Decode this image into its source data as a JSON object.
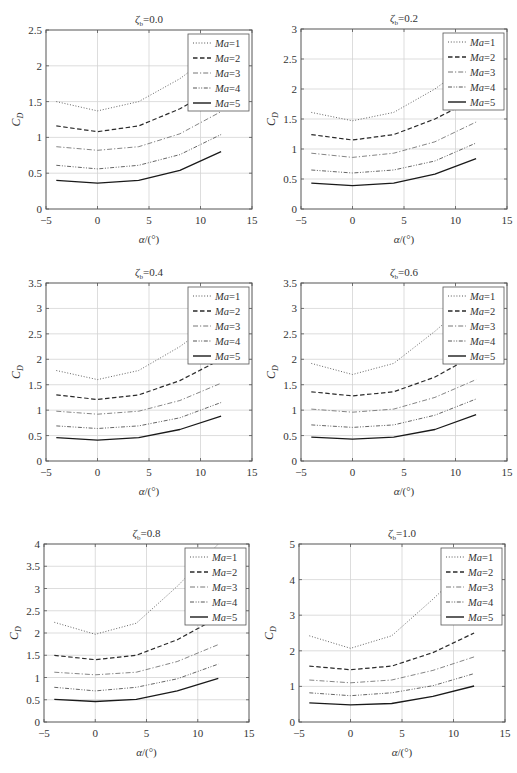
{
  "figure": {
    "x_label": "α/(°)",
    "y_label_main": "C",
    "y_label_sub": "D",
    "title_prefix_main": "ζ",
    "title_prefix_sub": "b",
    "legend_prefix": "Ma",
    "line_color": "#2a2a2a",
    "grid_color": "#d4d4d4",
    "axis_color": "#555555"
  },
  "chart_data": [
    {
      "type": "line",
      "title": "ζb=0.0",
      "title_value": "0.0",
      "xlabel": "α/(°)",
      "ylabel": "C_D",
      "xlim": [
        -5,
        15
      ],
      "ylim": [
        0,
        2.5
      ],
      "xticks": [
        -5,
        0,
        5,
        10,
        15
      ],
      "yticks": [
        0,
        0.5,
        1,
        1.5,
        2,
        2.5
      ],
      "ytick_labels": [
        "0",
        "0.5",
        "1",
        "1.5",
        "2",
        "2.5"
      ],
      "grid": true,
      "legend_position": "upper right",
      "x": [
        -4,
        0,
        4,
        8,
        12
      ],
      "series": [
        {
          "name": "Ma=1",
          "style": "dotted",
          "values": [
            1.5,
            1.37,
            1.5,
            1.82,
            2.25
          ]
        },
        {
          "name": "Ma=2",
          "style": "dashed",
          "values": [
            1.16,
            1.08,
            1.16,
            1.4,
            1.72
          ]
        },
        {
          "name": "Ma=3",
          "style": "dashdot",
          "values": [
            0.87,
            0.82,
            0.87,
            1.05,
            1.36
          ]
        },
        {
          "name": "Ma=4",
          "style": "dashdotdot",
          "values": [
            0.61,
            0.56,
            0.61,
            0.76,
            1.04
          ]
        },
        {
          "name": "Ma=5",
          "style": "solid",
          "values": [
            0.4,
            0.36,
            0.4,
            0.54,
            0.8
          ]
        }
      ]
    },
    {
      "type": "line",
      "title": "ζb=0.2",
      "title_value": "0.2",
      "xlabel": "α/(°)",
      "ylabel": "C_D",
      "xlim": [
        -5,
        15
      ],
      "ylim": [
        0,
        3
      ],
      "xticks": [
        -5,
        0,
        5,
        10,
        15
      ],
      "yticks": [
        0,
        0.5,
        1,
        1.5,
        2,
        2.5,
        3
      ],
      "ytick_labels": [
        "0",
        "0.5",
        "1",
        "1.5",
        "2",
        "2.5",
        "3"
      ],
      "grid": true,
      "legend_position": "upper right",
      "x": [
        -4,
        0,
        4,
        8,
        12
      ],
      "series": [
        {
          "name": "Ma=1",
          "style": "dotted",
          "values": [
            1.61,
            1.47,
            1.61,
            2.0,
            2.5
          ]
        },
        {
          "name": "Ma=2",
          "style": "dashed",
          "values": [
            1.24,
            1.15,
            1.24,
            1.5,
            1.85
          ]
        },
        {
          "name": "Ma=3",
          "style": "dashdot",
          "values": [
            0.93,
            0.86,
            0.93,
            1.12,
            1.45
          ]
        },
        {
          "name": "Ma=4",
          "style": "dashdotdot",
          "values": [
            0.65,
            0.6,
            0.65,
            0.8,
            1.1
          ]
        },
        {
          "name": "Ma=5",
          "style": "solid",
          "values": [
            0.43,
            0.39,
            0.43,
            0.58,
            0.84
          ]
        }
      ]
    },
    {
      "type": "line",
      "title": "ζb=0.4",
      "title_value": "0.4",
      "xlabel": "α/(°)",
      "ylabel": "C_D",
      "xlim": [
        -5,
        15
      ],
      "ylim": [
        0,
        3.5
      ],
      "xticks": [
        -5,
        0,
        5,
        10,
        15
      ],
      "yticks": [
        0,
        0.5,
        1,
        1.5,
        2,
        2.5,
        3,
        3.5
      ],
      "ytick_labels": [
        "0",
        "0.5",
        "1",
        "1.5",
        "2",
        "2.5",
        "3",
        "3.5"
      ],
      "grid": true,
      "legend_position": "upper right",
      "x": [
        -4,
        0,
        4,
        8,
        12
      ],
      "series": [
        {
          "name": "Ma=1",
          "style": "dotted",
          "values": [
            1.78,
            1.6,
            1.78,
            2.25,
            2.85
          ]
        },
        {
          "name": "Ma=2",
          "style": "dashed",
          "values": [
            1.3,
            1.21,
            1.3,
            1.58,
            2.0
          ]
        },
        {
          "name": "Ma=3",
          "style": "dashdot",
          "values": [
            0.98,
            0.92,
            0.98,
            1.19,
            1.53
          ]
        },
        {
          "name": "Ma=4",
          "style": "dashdotdot",
          "values": [
            0.69,
            0.64,
            0.69,
            0.85,
            1.15
          ]
        },
        {
          "name": "Ma=5",
          "style": "solid",
          "values": [
            0.46,
            0.41,
            0.46,
            0.62,
            0.88
          ]
        }
      ]
    },
    {
      "type": "line",
      "title": "ζb=0.6",
      "title_value": "0.6",
      "xlabel": "α/(°)",
      "ylabel": "C_D",
      "xlim": [
        -5,
        15
      ],
      "ylim": [
        0,
        3.5
      ],
      "xticks": [
        -5,
        0,
        5,
        10,
        15
      ],
      "yticks": [
        0,
        0.5,
        1,
        1.5,
        2,
        2.5,
        3,
        3.5
      ],
      "ytick_labels": [
        "0",
        "0.5",
        "1",
        "1.5",
        "2",
        "2.5",
        "3",
        "3.5"
      ],
      "grid": true,
      "legend_position": "upper right",
      "x": [
        -4,
        0,
        4,
        8,
        12
      ],
      "series": [
        {
          "name": "Ma=1",
          "style": "dotted",
          "values": [
            1.92,
            1.7,
            1.92,
            2.55,
            3.25
          ]
        },
        {
          "name": "Ma=2",
          "style": "dashed",
          "values": [
            1.36,
            1.28,
            1.36,
            1.65,
            2.1
          ]
        },
        {
          "name": "Ma=3",
          "style": "dashdot",
          "values": [
            1.02,
            0.96,
            1.02,
            1.25,
            1.6
          ]
        },
        {
          "name": "Ma=4",
          "style": "dashdotdot",
          "values": [
            0.71,
            0.66,
            0.71,
            0.9,
            1.22
          ]
        },
        {
          "name": "Ma=5",
          "style": "solid",
          "values": [
            0.47,
            0.43,
            0.47,
            0.62,
            0.91
          ]
        }
      ]
    },
    {
      "type": "line",
      "title": "ζb=0.8",
      "title_value": "0.8",
      "xlabel": "α/(°)",
      "ylabel": "C_D",
      "xlim": [
        -5,
        15
      ],
      "ylim": [
        0,
        4
      ],
      "xticks": [
        -5,
        0,
        5,
        10,
        15
      ],
      "yticks": [
        0,
        0.5,
        1,
        1.5,
        2,
        2.5,
        3,
        3.5,
        4
      ],
      "ytick_labels": [
        "0",
        "0.5",
        "1",
        "1.5",
        "2",
        "2.5",
        "3",
        "3.5",
        "4"
      ],
      "grid": true,
      "legend_position": "upper right",
      "x": [
        -4,
        0,
        4,
        8,
        12
      ],
      "series": [
        {
          "name": "Ma=1",
          "style": "dotted",
          "values": [
            2.24,
            1.97,
            2.22,
            3.05,
            4.0
          ]
        },
        {
          "name": "Ma=2",
          "style": "dashed",
          "values": [
            1.5,
            1.4,
            1.5,
            1.85,
            2.35
          ]
        },
        {
          "name": "Ma=3",
          "style": "dashdot",
          "values": [
            1.12,
            1.06,
            1.12,
            1.36,
            1.74
          ]
        },
        {
          "name": "Ma=4",
          "style": "dashdotdot",
          "values": [
            0.78,
            0.7,
            0.78,
            0.97,
            1.3
          ]
        },
        {
          "name": "Ma=5",
          "style": "solid",
          "values": [
            0.51,
            0.46,
            0.51,
            0.7,
            0.98
          ]
        }
      ]
    },
    {
      "type": "line",
      "title": "ζb=1.0",
      "title_value": "1.0",
      "xlabel": "α/(°)",
      "ylabel": "C_D",
      "xlim": [
        -5,
        15
      ],
      "ylim": [
        0,
        5
      ],
      "xticks": [
        -5,
        0,
        5,
        10,
        15
      ],
      "yticks": [
        0,
        1,
        2,
        3,
        4,
        5
      ],
      "ytick_labels": [
        "0",
        "1",
        "2",
        "3",
        "4",
        "5"
      ],
      "grid": true,
      "legend_position": "upper right",
      "x": [
        -4,
        0,
        4,
        8,
        12
      ],
      "series": [
        {
          "name": "Ma=1",
          "style": "dotted",
          "values": [
            2.42,
            2.07,
            2.42,
            3.45,
            4.55
          ]
        },
        {
          "name": "Ma=2",
          "style": "dashed",
          "values": [
            1.57,
            1.47,
            1.57,
            1.95,
            2.5
          ]
        },
        {
          "name": "Ma=3",
          "style": "dashdot",
          "values": [
            1.18,
            1.1,
            1.18,
            1.45,
            1.83
          ]
        },
        {
          "name": "Ma=4",
          "style": "dashdotdot",
          "values": [
            0.82,
            0.74,
            0.82,
            1.02,
            1.36
          ]
        },
        {
          "name": "Ma=5",
          "style": "solid",
          "values": [
            0.54,
            0.48,
            0.52,
            0.72,
            1.01
          ]
        }
      ]
    }
  ]
}
